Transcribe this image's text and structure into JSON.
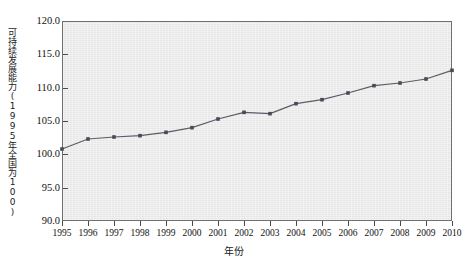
{
  "chart_data": {
    "type": "line",
    "title": "",
    "subtitle": "",
    "xlabel": "年份",
    "ylabel": "可持续发展能力(1995年全国为100)",
    "categories": [
      "1995",
      "1996",
      "1997",
      "1998",
      "1999",
      "2000",
      "2001",
      "2002",
      "2003",
      "2004",
      "2005",
      "2006",
      "2007",
      "2008",
      "2009",
      "2010"
    ],
    "values": [
      100.8,
      102.3,
      102.6,
      102.8,
      103.3,
      104.0,
      105.3,
      106.3,
      106.1,
      107.6,
      108.2,
      109.2,
      110.3,
      110.7,
      111.3,
      112.6
    ],
    "series": [
      {
        "name": "可持续发展能力",
        "values": [
          100.8,
          102.3,
          102.6,
          102.8,
          103.3,
          104.0,
          105.3,
          106.3,
          106.1,
          107.6,
          108.2,
          109.2,
          110.3,
          110.7,
          111.3,
          112.6
        ]
      }
    ],
    "x": [
      1995,
      1996,
      1997,
      1998,
      1999,
      2000,
      2001,
      2002,
      2003,
      2004,
      2005,
      2006,
      2007,
      2008,
      2009,
      2010
    ],
    "ylim": [
      90.0,
      120.0
    ],
    "xlim": [
      1995,
      2010
    ],
    "ytick_labels": [
      "120.0",
      "115.0",
      "110.0",
      "105.0",
      "100.0",
      "95.0",
      "90.0"
    ],
    "ytick_values": [
      120.0,
      115.0,
      110.0,
      105.0,
      100.0,
      95.0,
      90.0
    ],
    "xtick_labels": [
      "1995",
      "1996",
      "1997",
      "1998",
      "1999",
      "2000",
      "2001",
      "2002",
      "2003",
      "2004",
      "2005",
      "2006",
      "2007",
      "2008",
      "2009",
      "2010"
    ],
    "grid": false,
    "legend": null,
    "legend_position": "none",
    "annotations": [],
    "colors": {
      "line": "#5c5c66",
      "marker": "#4a4a55",
      "plot_background": "#ececec",
      "frame": "#6f6f6f",
      "page_background": "#ffffff",
      "text": "#111111"
    },
    "marker": "square",
    "marker_size": 3.6,
    "line_width": 1.2
  }
}
